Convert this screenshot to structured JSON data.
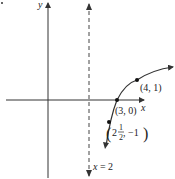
{
  "diagram": {
    "type": "function-graph",
    "axes": {
      "x_label": "x",
      "y_label": "y"
    },
    "asymptote": {
      "label_var": "x",
      "label_eq": " = 2",
      "style": "dashed"
    },
    "points": [
      {
        "label": "(4, 1)",
        "x": 4,
        "y": 1
      },
      {
        "label": "(3, 0)",
        "x": 3,
        "y": 0
      },
      {
        "label_whole": "2",
        "label_num": "1",
        "label_den": "2",
        "label_rest": ", −1",
        "x": 2.5,
        "y": -1
      }
    ],
    "colors": {
      "curve": "#333333",
      "axis": "#333333"
    }
  }
}
